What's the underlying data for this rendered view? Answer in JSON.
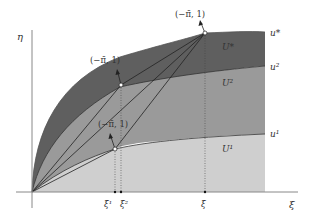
{
  "axes": {
    "x_label": "ξ",
    "y_label": "η"
  },
  "curves": [
    {
      "name": "u*",
      "label": "u*"
    },
    {
      "name": "u2",
      "label": "u²"
    },
    {
      "name": "u1",
      "label": "u¹"
    }
  ],
  "regions": [
    {
      "name": "U*",
      "label": "U*"
    },
    {
      "name": "U2",
      "label": "U²"
    },
    {
      "name": "U1",
      "label": "U¹"
    }
  ],
  "normal_labels": [
    {
      "id": "top",
      "text": "(−π̄, 1)"
    },
    {
      "id": "middle",
      "text": "(−π̄, 1)"
    },
    {
      "id": "bottom",
      "text": "(−π̄, 1)"
    }
  ],
  "x_ticks": [
    {
      "id": "xi1",
      "text": "ξ̄¹"
    },
    {
      "id": "xi2",
      "text": "ξ̄²"
    },
    {
      "id": "xibar",
      "text": "ξ̄"
    }
  ],
  "colors": {
    "U_star": "#5f5f5f",
    "U2": "#9a9a9a",
    "U1": "#cfcfcf",
    "axis": "#888888",
    "line": "#222222"
  }
}
